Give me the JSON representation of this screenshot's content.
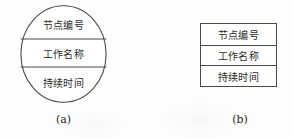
{
  "figure": {
    "node_fields": [
      {
        "key": "node_number",
        "label": "节点编号"
      },
      {
        "key": "activity_name",
        "label": "工作名称"
      },
      {
        "key": "duration",
        "label": "持续时间"
      }
    ],
    "variants": [
      {
        "id": "a",
        "shape": "ellipse",
        "caption": "(a)",
        "rows": [
          "节点编号",
          "工作名称",
          "持续时间"
        ]
      },
      {
        "id": "b",
        "shape": "rectangle",
        "caption": "(b)",
        "rows": [
          "节点编号",
          "工作名称",
          "持续时间"
        ]
      }
    ],
    "colors": {
      "stroke": "#4a4a4a",
      "text": "#2b2b2b",
      "background": "#fdfdfd"
    }
  }
}
